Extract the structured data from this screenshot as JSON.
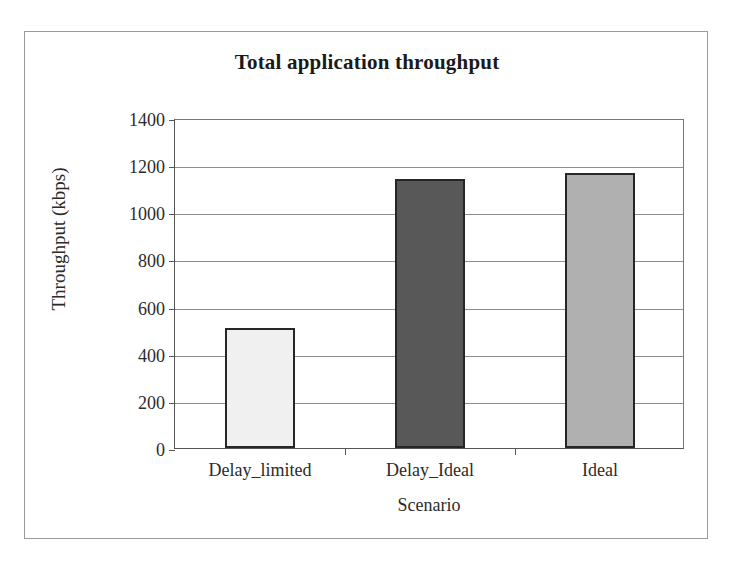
{
  "figure": {
    "background_color": "#ffffff",
    "frame_color": "#9a9a9a"
  },
  "chart_data": {
    "type": "bar",
    "title": "Total application throughput",
    "xlabel": "Scenario",
    "ylabel": "Throughput (kbps)",
    "categories": [
      "Delay_limited",
      "Delay_Ideal",
      "Ideal"
    ],
    "values": [
      510,
      1140,
      1165
    ],
    "series": [
      {
        "name": "Throughput",
        "values": [
          510,
          1140,
          1165
        ]
      }
    ],
    "ylim": [
      0,
      1400
    ],
    "ytick_step": 200,
    "yticks": [
      1400,
      1200,
      1000,
      800,
      600,
      400,
      200,
      0
    ],
    "ytick_labels": [
      "1400",
      "1200",
      "1000",
      "800",
      "600",
      "400",
      "200",
      "0"
    ],
    "grid": true,
    "grid_axis": "y",
    "legend": false,
    "legend_position": "none",
    "bar_colors": [
      "#f0f0f0",
      "#585858",
      "#b0b0b0"
    ],
    "bar_edge_color": "#262626",
    "gridline_color": "#8d8d8d",
    "axis_color": "#555555"
  }
}
